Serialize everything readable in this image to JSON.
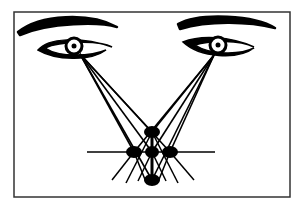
{
  "diagram": {
    "type": "eye-convergence-illustration",
    "frame": {
      "x": 14,
      "y": 12,
      "width": 276,
      "height": 185,
      "stroke": "#333333"
    },
    "colors": {
      "ink": "#000000",
      "background": "#ffffff"
    },
    "eyes": [
      {
        "id": "left",
        "brow": "M18,32 C40,14 90,12 117,27 C100,22 50,22 20,35 Z",
        "eye_outline": "M38,50 C48,38 80,36 112,47 C100,40 60,41 45,48 C60,58 92,56 106,50 C90,62 55,60 38,50 Z",
        "iris": {
          "cx": 74,
          "cy": 46,
          "r": 8
        },
        "pupil_origin": {
          "x": 80,
          "y": 54
        }
      },
      {
        "id": "right",
        "brow": "M178,24 C200,12 255,15 275,28 C250,22 210,20 180,29 Z",
        "eye_outline": "M183,42 C200,35 230,36 254,47 C240,40 210,40 195,45 C210,55 240,55 254,48 C238,60 200,58 183,42 Z",
        "iris": {
          "cx": 218,
          "cy": 45,
          "r": 8
        },
        "pupil_origin": {
          "x": 214,
          "y": 55
        }
      }
    ],
    "targets": [
      {
        "id": "top",
        "cx": 152,
        "cy": 132,
        "rx": 8,
        "ry": 6
      },
      {
        "id": "left",
        "cx": 134,
        "cy": 152,
        "rx": 8,
        "ry": 6
      },
      {
        "id": "center",
        "cx": 152,
        "cy": 152,
        "rx": 7,
        "ry": 6
      },
      {
        "id": "right",
        "cx": 170,
        "cy": 152,
        "rx": 8,
        "ry": 6
      },
      {
        "id": "bottom",
        "cx": 152,
        "cy": 180,
        "rx": 8,
        "ry": 6
      }
    ],
    "horizontal_axis": {
      "x1": 87,
      "x2": 215,
      "y": 152
    },
    "vertical_axis": {
      "x": 152,
      "y1": 128,
      "y2": 182
    },
    "sight_lines_left": [
      {
        "to_x": 152,
        "to_y": 132
      },
      {
        "to_x": 134,
        "to_y": 152
      },
      {
        "to_x": 152,
        "to_y": 152
      },
      {
        "to_x": 170,
        "to_y": 152
      },
      {
        "to_x": 152,
        "to_y": 180
      }
    ],
    "sight_lines_right": [
      {
        "to_x": 152,
        "to_y": 132
      },
      {
        "to_x": 134,
        "to_y": 152
      },
      {
        "to_x": 152,
        "to_y": 152
      },
      {
        "to_x": 170,
        "to_y": 152
      },
      {
        "to_x": 152,
        "to_y": 180
      }
    ],
    "extension_lines": [
      {
        "x1": 152,
        "y1": 132,
        "x2": 178,
        "y2": 183
      },
      {
        "x1": 152,
        "y1": 132,
        "x2": 126,
        "y2": 183
      },
      {
        "x1": 134,
        "y1": 152,
        "x2": 146,
        "y2": 182
      },
      {
        "x1": 170,
        "y1": 152,
        "x2": 158,
        "y2": 182
      },
      {
        "x1": 134,
        "y1": 152,
        "x2": 112,
        "y2": 180
      },
      {
        "x1": 170,
        "y1": 152,
        "x2": 194,
        "y2": 180
      },
      {
        "x1": 152,
        "y1": 152,
        "x2": 138,
        "y2": 181
      },
      {
        "x1": 152,
        "y1": 152,
        "x2": 166,
        "y2": 181
      }
    ]
  }
}
